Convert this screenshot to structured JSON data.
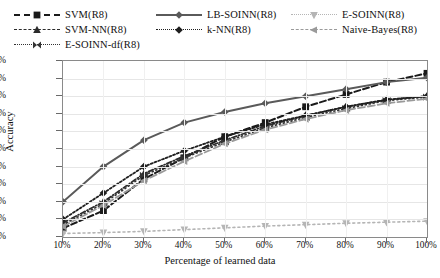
{
  "chart_data": {
    "type": "line",
    "title": "",
    "xlabel": "Percentage of learned data",
    "ylabel": "Accuracy",
    "categories": [
      "10%",
      "20%",
      "30%",
      "40%",
      "50%",
      "60%",
      "70%",
      "80%",
      "90%",
      "100%"
    ],
    "x": [
      10,
      20,
      30,
      40,
      50,
      60,
      70,
      80,
      90,
      100
    ],
    "xlim": [
      10,
      100
    ],
    "ylim": [
      0,
      100
    ],
    "ytick_labels": [
      "100.00%",
      "90.00%",
      "80.00%",
      "70.00%",
      "60.00%",
      "50.00%",
      "40.00%",
      "30.00%",
      "20.00%",
      "10.00%",
      "0.00%"
    ],
    "ytick_values": [
      100,
      90,
      80,
      70,
      60,
      50,
      40,
      30,
      20,
      10,
      0
    ],
    "grid": true,
    "legend_position": "top",
    "series": [
      {
        "name": "SVM(R8)",
        "values": [
          5.0,
          15.0,
          33.0,
          45.0,
          57.0,
          65.0,
          74.0,
          81.0,
          88.0,
          93.0
        ],
        "color": "#1a1a1a",
        "marker": "square",
        "dash": "6,3",
        "width": 2.0
      },
      {
        "name": "SVM-NN(R8)",
        "values": [
          8.0,
          20.0,
          36.0,
          46.0,
          55.0,
          63.0,
          69.0,
          74.0,
          78.0,
          80.0
        ],
        "color": "#2b2b2b",
        "marker": "triangle-up",
        "dash": "5,2,1,2",
        "width": 1.7
      },
      {
        "name": "E-SOINN-df(R8)",
        "values": [
          7.0,
          19.0,
          35.0,
          45.0,
          54.0,
          62.0,
          68.0,
          73.0,
          77.5,
          79.5
        ],
        "color": "#333333",
        "marker": "bowtie",
        "dash": "1,3",
        "width": 1.7
      },
      {
        "name": "LB-SOINN(R8)",
        "values": [
          20.0,
          40.0,
          55.0,
          65.0,
          71.0,
          76.0,
          80.0,
          84.0,
          88.0,
          90.5
        ],
        "color": "#5a5a5a",
        "marker": "diamond",
        "dash": "none",
        "width": 2.0
      },
      {
        "name": "k-NN(R8)",
        "values": [
          10.0,
          25.0,
          40.0,
          49.0,
          57.0,
          64.0,
          69.0,
          74.0,
          78.0,
          80.0
        ],
        "color": "#1f1f1f",
        "marker": "diamond",
        "dash": "2,2",
        "width": 1.8
      },
      {
        "name": "E-SOINN(R8)",
        "values": [
          2.0,
          2.5,
          3.2,
          4.2,
          5.2,
          6.2,
          7.0,
          7.8,
          8.4,
          9.0
        ],
        "color": "#b5b5b5",
        "marker": "triangle-down",
        "dash": "2,3",
        "width": 1.6
      },
      {
        "name": "Naive-Bayes(R8)",
        "values": [
          6.0,
          18.0,
          32.0,
          43.0,
          53.0,
          61.0,
          67.0,
          72.0,
          76.0,
          78.5
        ],
        "color": "#9a9a9a",
        "marker": "triangle-left",
        "dash": "7,3",
        "width": 1.8
      }
    ]
  }
}
